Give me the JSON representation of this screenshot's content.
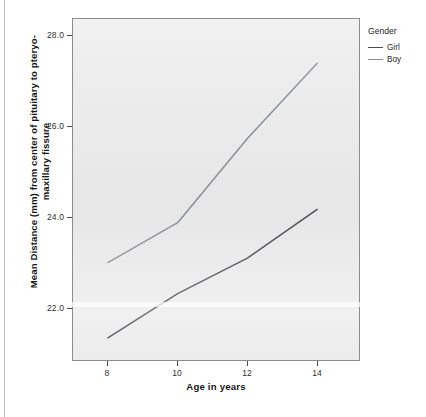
{
  "chart_data": {
    "type": "line",
    "title": "",
    "xlabel": "Age in years",
    "ylabel": "Mean Distance (mm) from center of pituitary to pteryo-maxillary fissure",
    "x": [
      8,
      10,
      12,
      14
    ],
    "xtick_labels": [
      "8",
      "10",
      "12",
      "14"
    ],
    "ytick_labels": [
      "22.0",
      "24.0",
      "26.0",
      "28.0"
    ],
    "yticks": [
      22.0,
      24.0,
      26.0,
      28.0
    ],
    "xlim": [
      7.0,
      15.2
    ],
    "ylim": [
      20.7,
      28.4
    ],
    "grid": false,
    "legend_position": "right",
    "legend_title": "Gender",
    "series": [
      {
        "name": "Girl",
        "color": "#4a4f57",
        "values": [
          21.2,
          22.2,
          23.0,
          24.1
        ]
      },
      {
        "name": "Boy",
        "color": "#8b9199",
        "values": [
          22.9,
          23.8,
          25.7,
          27.4
        ]
      }
    ]
  },
  "axes": {
    "y_title": "Mean Distance (mm) from center of pituitary to pteryo-maxillary fissure",
    "x_title": "Age in years"
  },
  "legend": {
    "title": "Gender",
    "items": [
      {
        "label": "Girl",
        "color": "#4a4f57"
      },
      {
        "label": "Boy",
        "color": "#8b9199"
      }
    ]
  },
  "caption": {
    "text": ""
  }
}
